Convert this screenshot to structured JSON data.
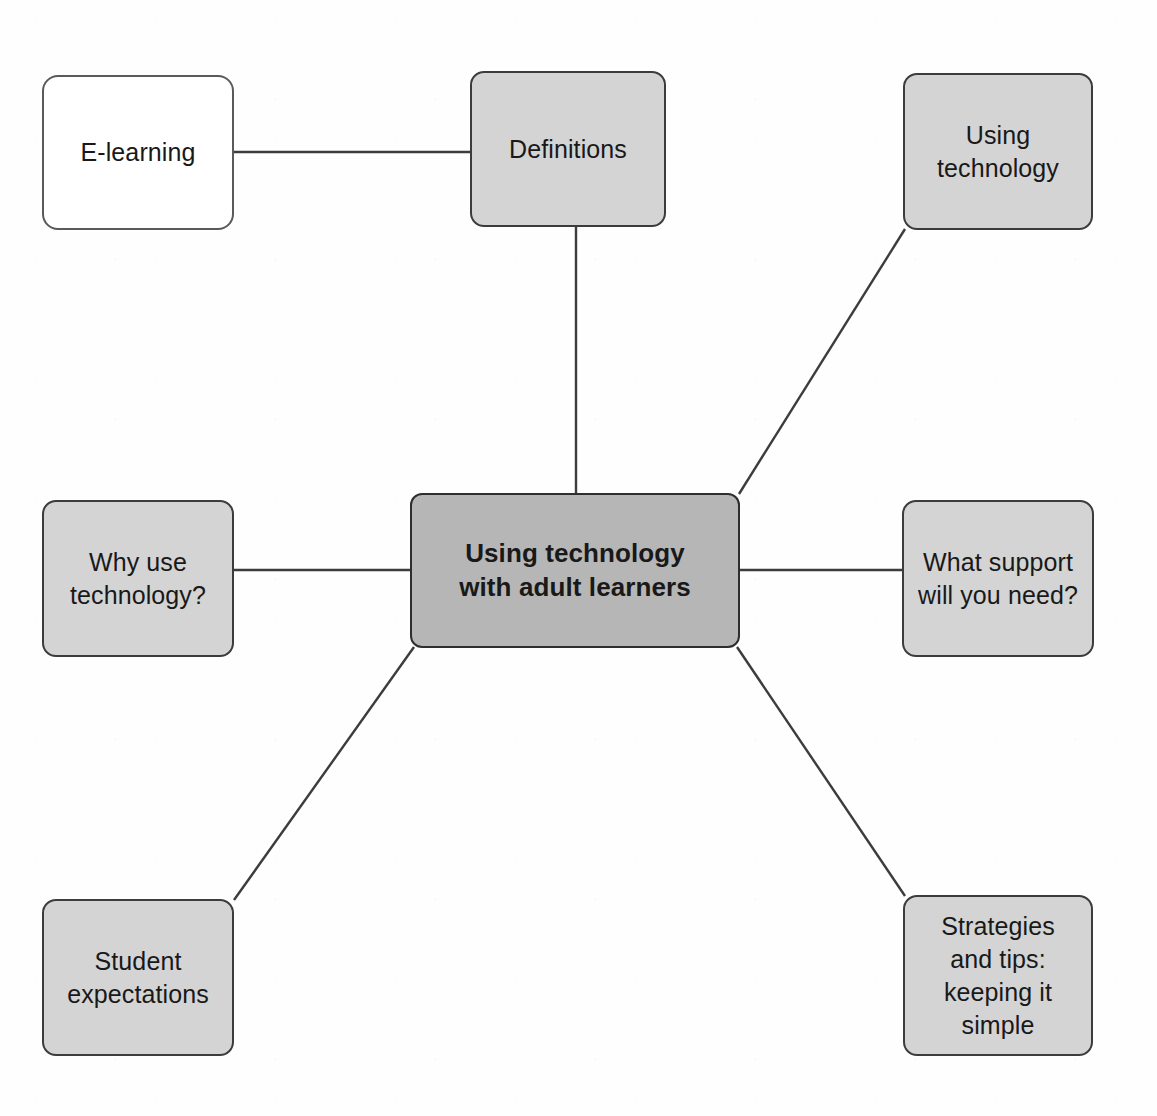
{
  "diagram": {
    "type": "mind-map",
    "title": "Using technology with adult learners",
    "background_color": "#ffffff",
    "node_fill": "#d4d4d4",
    "hub_fill": "#b6b6b6",
    "root_fill": "#ffffff",
    "border_color": "#3c3c3c",
    "edge_color": "#3c3c3c",
    "text_color": "#191919"
  },
  "nodes": {
    "root": {
      "label": "E-learning"
    },
    "definitions": {
      "label": "Definitions"
    },
    "using_technology": {
      "label": "Using\ntechnology"
    },
    "hub": {
      "label": "Using technology\nwith adult learners"
    },
    "why_use_technology": {
      "label": "Why use\ntechnology?"
    },
    "what_support": {
      "label": "What support\nwill you need?"
    },
    "student_expectations": {
      "label": "Student\nexpectations"
    },
    "strategies_tips": {
      "label": "Strategies\nand tips:\nkeeping it\nsimple"
    }
  },
  "edges": [
    {
      "from": "root",
      "to": "definitions",
      "style": "straight"
    },
    {
      "from": "definitions",
      "to": "hub",
      "style": "straight"
    },
    {
      "from": "using_technology",
      "to": "hub",
      "style": "straight"
    },
    {
      "from": "why_use_technology",
      "to": "hub",
      "style": "straight"
    },
    {
      "from": "what_support",
      "to": "hub",
      "style": "straight"
    },
    {
      "from": "student_expectations",
      "to": "hub",
      "style": "straight"
    },
    {
      "from": "strategies_tips",
      "to": "hub",
      "style": "straight"
    }
  ]
}
